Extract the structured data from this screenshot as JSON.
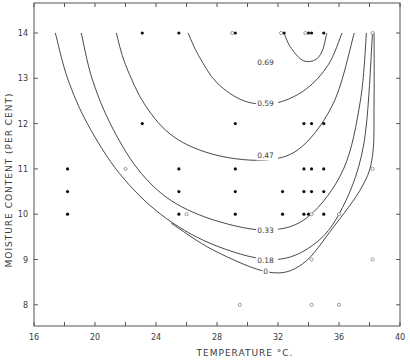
{
  "chart_data": {
    "type": "scatter",
    "title": "",
    "xlabel": "TEMPERATURE °C.",
    "ylabel": "MOISTURE CONTENT (PER CENT)",
    "xlim": [
      16,
      40
    ],
    "ylim": [
      7.5,
      14.7
    ],
    "x_ticks": [
      16,
      20,
      24,
      28,
      32,
      36,
      40
    ],
    "x_minor_ticks": [
      18,
      22,
      26,
      30,
      34,
      38
    ],
    "y_ticks": [
      8,
      9,
      10,
      11,
      12,
      13,
      14
    ],
    "grid": false,
    "legend": null,
    "series": [
      {
        "name": "filled points",
        "marker": "filled-dot",
        "points": [
          [
            23.1,
            14
          ],
          [
            25.5,
            14
          ],
          [
            29.2,
            14
          ],
          [
            32.4,
            14
          ],
          [
            34.0,
            14
          ],
          [
            34.2,
            14
          ],
          [
            35.0,
            14
          ],
          [
            23.1,
            12
          ],
          [
            29.2,
            12
          ],
          [
            33.7,
            12
          ],
          [
            34.2,
            12
          ],
          [
            35.0,
            12
          ],
          [
            18.2,
            11
          ],
          [
            25.5,
            11
          ],
          [
            29.2,
            11
          ],
          [
            33.7,
            11
          ],
          [
            34.2,
            11
          ],
          [
            35.0,
            11
          ],
          [
            18.2,
            10.5
          ],
          [
            25.5,
            10.5
          ],
          [
            29.2,
            10.5
          ],
          [
            32.3,
            10.5
          ],
          [
            33.7,
            10.5
          ],
          [
            34.2,
            10.5
          ],
          [
            35.0,
            10.5
          ],
          [
            18.2,
            10
          ],
          [
            25.5,
            10
          ],
          [
            29.2,
            10
          ],
          [
            32.3,
            10
          ],
          [
            33.7,
            10
          ],
          [
            34.0,
            10
          ],
          [
            35.0,
            10
          ]
        ]
      },
      {
        "name": "open points",
        "marker": "open-circle",
        "points": [
          [
            22.0,
            11
          ],
          [
            26.0,
            10
          ],
          [
            29.0,
            14
          ],
          [
            32.2,
            14
          ],
          [
            33.8,
            14
          ],
          [
            34.2,
            10
          ],
          [
            36.0,
            10
          ],
          [
            38.2,
            14
          ],
          [
            38.2,
            11
          ],
          [
            34.2,
            9
          ],
          [
            38.2,
            9
          ],
          [
            29.5,
            8
          ],
          [
            34.2,
            8
          ],
          [
            36.0,
            8
          ]
        ]
      }
    ],
    "contours": [
      {
        "label": "0.69",
        "label_at": [
          30.5,
          13.35
        ],
        "path": [
          [
            32.4,
            14
          ],
          [
            32.8,
            13.7
          ],
          [
            33.6,
            13.4
          ],
          [
            34.4,
            13.4
          ],
          [
            34.9,
            13.6
          ],
          [
            35.2,
            14
          ]
        ]
      },
      {
        "label": "0.59",
        "label_at": [
          30.5,
          12.45
        ],
        "path": [
          [
            26.1,
            14
          ],
          [
            26.8,
            13.5
          ],
          [
            28.0,
            12.9
          ],
          [
            29.8,
            12.5
          ],
          [
            31.8,
            12.45
          ],
          [
            33.8,
            12.75
          ],
          [
            35.3,
            13.3
          ],
          [
            36.2,
            14
          ]
        ]
      },
      {
        "label": "0.47",
        "label_at": [
          30.5,
          11.3
        ],
        "path": [
          [
            21.4,
            14
          ],
          [
            22.0,
            13.3
          ],
          [
            23.3,
            12.4
          ],
          [
            25.2,
            11.7
          ],
          [
            28.0,
            11.3
          ],
          [
            31.3,
            11.2
          ],
          [
            33.6,
            11.5
          ],
          [
            35.7,
            12.5
          ],
          [
            37.0,
            14
          ]
        ]
      },
      {
        "label": "0.33",
        "label_at": [
          30.5,
          9.65
        ],
        "path": [
          [
            19.1,
            14
          ],
          [
            19.8,
            13.0
          ],
          [
            21.0,
            12.0
          ],
          [
            22.8,
            11.0
          ],
          [
            25.0,
            10.3
          ],
          [
            28.0,
            9.85
          ],
          [
            31.4,
            9.65
          ],
          [
            34.0,
            9.95
          ],
          [
            36.3,
            11.0
          ],
          [
            37.4,
            12.5
          ],
          [
            37.8,
            14
          ]
        ]
      },
      {
        "label": "0.18",
        "label_at": [
          30.5,
          9.0
        ],
        "path": [
          [
            17.4,
            14
          ],
          [
            18.2,
            13.0
          ],
          [
            19.5,
            12.0
          ],
          [
            21.6,
            10.9
          ],
          [
            24.3,
            10.0
          ],
          [
            27.6,
            9.35
          ],
          [
            31.4,
            9.0
          ],
          [
            34.0,
            9.25
          ],
          [
            36.0,
            10.0
          ],
          [
            37.6,
            11.5
          ],
          [
            38.2,
            14
          ]
        ]
      },
      {
        "label": "0",
        "label_at": [
          30.9,
          8.75
        ],
        "path": [
          [
            25.0,
            9.8
          ],
          [
            27.8,
            9.2
          ],
          [
            31.4,
            8.72
          ],
          [
            33.6,
            8.9
          ],
          [
            35.6,
            9.7
          ],
          [
            37.5,
            10.6
          ],
          [
            38.2,
            11.3
          ],
          [
            38.3,
            12.5
          ],
          [
            38.3,
            14
          ]
        ]
      }
    ]
  },
  "axes": {
    "x_title": "TEMPERATURE °C.",
    "y_title": "MOISTURE CONTENT (PER CENT)",
    "x_tick_labels": [
      "16",
      "20",
      "24",
      "28",
      "32",
      "36",
      "40"
    ],
    "y_tick_labels": [
      "8",
      "9",
      "10",
      "11",
      "12",
      "13",
      "14"
    ]
  },
  "colors": {
    "ink": "#333333",
    "frame": "#555555",
    "open_marker": "#777777",
    "background": "#ffffff"
  }
}
